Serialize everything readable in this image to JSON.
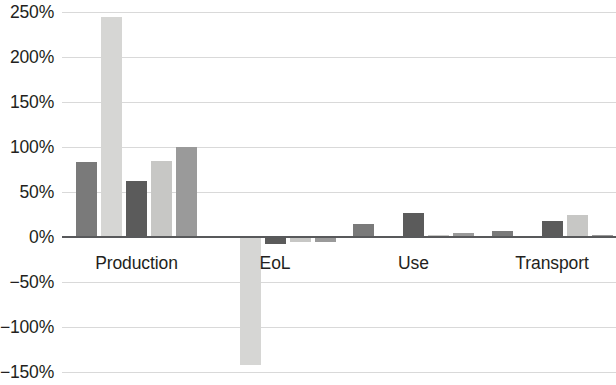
{
  "chart_data": {
    "type": "bar",
    "title": "",
    "subtitle": "",
    "xlabel": "",
    "ylabel": "",
    "categories": [
      "Production",
      "EoL",
      "Use",
      "Transport"
    ],
    "series": [
      {
        "name": "Series 1",
        "color": "#7a7a7a",
        "values": [
          83,
          -1,
          14,
          7
        ]
      },
      {
        "name": "Series 2",
        "color": "#d6d6d4",
        "values": [
          244,
          -142,
          0,
          0
        ]
      },
      {
        "name": "Series 3",
        "color": "#5b5b5b",
        "values": [
          62,
          -8,
          27,
          18
        ]
      },
      {
        "name": "Series 4",
        "color": "#c7c7c5",
        "values": [
          84,
          -6,
          2,
          24
        ]
      },
      {
        "name": "Series 5",
        "color": "#9a9a9a",
        "values": [
          100,
          -5,
          5,
          2
        ]
      }
    ],
    "ylim": [
      -150,
      250
    ],
    "y_ticks": [
      250,
      200,
      150,
      100,
      50,
      0,
      -50,
      -100,
      -150
    ],
    "y_tick_labels": [
      "250%",
      "200%",
      "150%",
      "100%",
      "50%",
      "0%",
      "−50%",
      "−100%",
      "−150%"
    ],
    "grid": true,
    "grid_axis": "y",
    "legend": "none",
    "value_format": "percent",
    "zero_line_color": "#58595b",
    "gridline_color": "#d9d9d9",
    "background_color": "#ffffff",
    "text_color": "#231f20"
  }
}
